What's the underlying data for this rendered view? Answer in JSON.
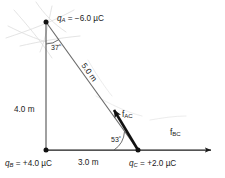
{
  "diagram": {
    "background_color": "#ffffff",
    "line_color": "#2b2b2b",
    "vector_color": "#111111",
    "artifact_color": "#d8d8d8",
    "vertices": {
      "A": {
        "x": 46,
        "y": 22,
        "position": "top"
      },
      "B": {
        "x": 46,
        "y": 150,
        "position": "bottom-left"
      },
      "C": {
        "x": 138,
        "y": 150,
        "position": "bottom-right"
      }
    },
    "charges": {
      "qA": {
        "symbol": "q",
        "subscript": "A",
        "equals": "=",
        "value": "−6.0",
        "unit": "µC",
        "full": "q_A = −6.0 µC"
      },
      "qB": {
        "symbol": "q",
        "subscript": "B",
        "equals": "=",
        "value": "+4.0",
        "unit": "µC",
        "full": "q_B = +4.0 µC"
      },
      "qC": {
        "symbol": "q",
        "subscript": "C",
        "equals": "=",
        "value": "+2.0",
        "unit": "µC",
        "full": "q_C = +2.0 µC"
      }
    },
    "distances": {
      "ab": {
        "value": "4.0",
        "unit": "m",
        "full": "4.0 m",
        "side": "vertical-leg"
      },
      "bc": {
        "value": "3.0",
        "unit": "m",
        "full": "3.0 m",
        "side": "horizontal-leg"
      },
      "ac": {
        "value": "5.0",
        "unit": "m",
        "full": "5.0 m",
        "side": "hypotenuse"
      }
    },
    "angles": {
      "at_A": {
        "value": "37",
        "unit": "°",
        "full": "37°"
      },
      "at_C": {
        "value": "53",
        "unit": "°",
        "full": "53°"
      }
    },
    "forces": {
      "f_ac": {
        "symbol": "f",
        "subscript": "AC",
        "full": "f_AC",
        "direction": "from C toward A (up-left)"
      },
      "f_bc": {
        "symbol": "f",
        "subscript": "BC",
        "full": "f_BC",
        "direction": "from C to the right (away from B)"
      }
    }
  }
}
